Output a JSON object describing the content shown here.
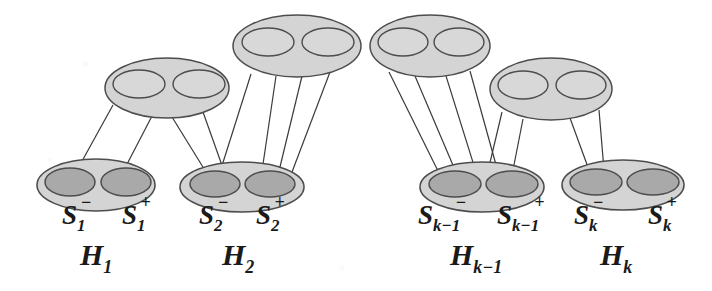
{
  "figure": {
    "kind": "hypergraph-chain-diagram",
    "background_color": "#ffffff",
    "outline_color": "#4d4d4d",
    "outer_ellipse_fill": "#d4d4d4",
    "inner_ellipse_fill_top": "#d8d8d8",
    "inner_ellipse_fill_bottom": "#a9a9a9",
    "edge_line_color": "#3a3a3a",
    "label_color": "#1a1a1a"
  },
  "top_nodes": [
    {
      "id": "top-1",
      "cx": 167,
      "cy": 88,
      "rx": 62,
      "ry": 30,
      "left_cx": 139,
      "right_cx": 199,
      "lobe_cy": 84,
      "lobe_rx": 26,
      "lobe_ry": 14
    },
    {
      "id": "top-2",
      "cx": 297,
      "cy": 46,
      "rx": 64,
      "ry": 31,
      "left_cx": 268,
      "right_cx": 328,
      "lobe_cy": 42,
      "lobe_rx": 26,
      "lobe_ry": 14
    },
    {
      "id": "top-3",
      "cx": 430,
      "cy": 46,
      "rx": 60,
      "ry": 31,
      "left_cx": 403,
      "right_cx": 459,
      "lobe_cy": 42,
      "lobe_rx": 25,
      "lobe_ry": 14
    },
    {
      "id": "top-4",
      "cx": 551,
      "cy": 89,
      "rx": 61,
      "ry": 31,
      "left_cx": 523,
      "right_cx": 581,
      "lobe_cy": 85,
      "lobe_rx": 25,
      "lobe_ry": 14
    }
  ],
  "bottom_nodes": [
    {
      "id": "H1",
      "cx": 96,
      "cy": 185,
      "rx": 59,
      "ry": 26,
      "minus": {
        "cx": 70,
        "cy": 182,
        "rx": 25,
        "ry": 14,
        "label": "S",
        "sub": "1",
        "sup": "−",
        "label_x": 62,
        "label_y": 224
      },
      "plus": {
        "cx": 126,
        "cy": 182,
        "rx": 25,
        "ry": 14,
        "label": "S",
        "sub": "1",
        "sup": "+",
        "label_x": 122,
        "label_y": 224
      },
      "name_label": "H",
      "name_sub": "1",
      "name_x": 80,
      "name_y": 265
    },
    {
      "id": "H2",
      "cx": 242,
      "cy": 187,
      "rx": 62,
      "ry": 25,
      "minus": {
        "cx": 215,
        "cy": 184,
        "rx": 25,
        "ry": 13,
        "label": "S",
        "sub": "2",
        "sup": "−",
        "label_x": 199,
        "label_y": 224
      },
      "plus": {
        "cx": 270,
        "cy": 184,
        "rx": 25,
        "ry": 13,
        "label": "S",
        "sub": "2",
        "sup": "+",
        "label_x": 256,
        "label_y": 224
      },
      "name_label": "H",
      "name_sub": "2",
      "name_x": 222,
      "name_y": 265
    },
    {
      "id": "Hk-1",
      "cx": 482,
      "cy": 187,
      "rx": 62,
      "ry": 25,
      "minus": {
        "cx": 455,
        "cy": 184,
        "rx": 26,
        "ry": 13,
        "label": "S",
        "sub": "k−1",
        "sup": "−",
        "label_x": 418,
        "label_y": 224
      },
      "plus": {
        "cx": 512,
        "cy": 184,
        "rx": 26,
        "ry": 13,
        "label": "S",
        "sub": "k−1",
        "sup": "+",
        "label_x": 497,
        "label_y": 224
      },
      "name_label": "H",
      "name_sub": "k−1",
      "name_x": 450,
      "name_y": 265
    },
    {
      "id": "Hk",
      "cx": 623,
      "cy": 185,
      "rx": 61,
      "ry": 25,
      "minus": {
        "cx": 596,
        "cy": 182,
        "rx": 26,
        "ry": 13,
        "label": "S",
        "sub": "k",
        "sup": "−",
        "label_x": 574,
        "label_y": 224
      },
      "plus": {
        "cx": 653,
        "cy": 182,
        "rx": 26,
        "ry": 13,
        "label": "S",
        "sub": "k",
        "sup": "+",
        "label_x": 648,
        "label_y": 224
      },
      "name_label": "H",
      "name_sub": "k",
      "name_x": 600,
      "name_y": 265
    }
  ],
  "connector": {
    "x1": 359,
    "y1": 48,
    "x2": 371,
    "y2": 48
  },
  "edges": [
    {
      "from": "top-1",
      "to": "H1-plus",
      "x1": 113,
      "y1": 105,
      "x2": 76,
      "y2": 172
    },
    {
      "from": "top-1",
      "to": "H1-plus",
      "x1": 152,
      "y1": 116,
      "x2": 124,
      "y2": 170
    },
    {
      "from": "top-1",
      "to": "H2-minus",
      "x1": 172,
      "y1": 117,
      "x2": 206,
      "y2": 172
    },
    {
      "from": "top-1",
      "to": "H2-minus",
      "x1": 203,
      "y1": 112,
      "x2": 224,
      "y2": 171
    },
    {
      "from": "top-2",
      "to": "H2-minus",
      "x1": 251,
      "y1": 74,
      "x2": 220,
      "y2": 172
    },
    {
      "from": "top-2",
      "to": "H2-plus",
      "x1": 276,
      "y1": 76,
      "x2": 262,
      "y2": 171
    },
    {
      "from": "top-2",
      "to": "H2-plus",
      "x1": 302,
      "y1": 76,
      "x2": 279,
      "y2": 171
    },
    {
      "from": "top-2",
      "to": "H2-plus",
      "x1": 330,
      "y1": 72,
      "x2": 292,
      "y2": 172
    },
    {
      "from": "top-3",
      "to": "Hk-1-minus",
      "x1": 389,
      "y1": 72,
      "x2": 438,
      "y2": 171
    },
    {
      "from": "top-3",
      "to": "Hk-1-minus",
      "x1": 415,
      "y1": 76,
      "x2": 455,
      "y2": 170
    },
    {
      "from": "top-3",
      "to": "Hk-1-plus",
      "x1": 446,
      "y1": 76,
      "x2": 476,
      "y2": 172
    },
    {
      "from": "top-3",
      "to": "Hk-1-plus",
      "x1": 470,
      "y1": 71,
      "x2": 498,
      "y2": 172
    },
    {
      "from": "top-4",
      "to": "Hk-1-plus",
      "x1": 502,
      "y1": 112,
      "x2": 488,
      "y2": 171
    },
    {
      "from": "top-4",
      "to": "Hk-1-plus",
      "x1": 523,
      "y1": 119,
      "x2": 513,
      "y2": 170
    },
    {
      "from": "top-4",
      "to": "Hk-minus",
      "x1": 570,
      "y1": 118,
      "x2": 589,
      "y2": 170
    },
    {
      "from": "top-4",
      "to": "Hk-minus",
      "x1": 599,
      "y1": 110,
      "x2": 604,
      "y2": 170
    }
  ]
}
